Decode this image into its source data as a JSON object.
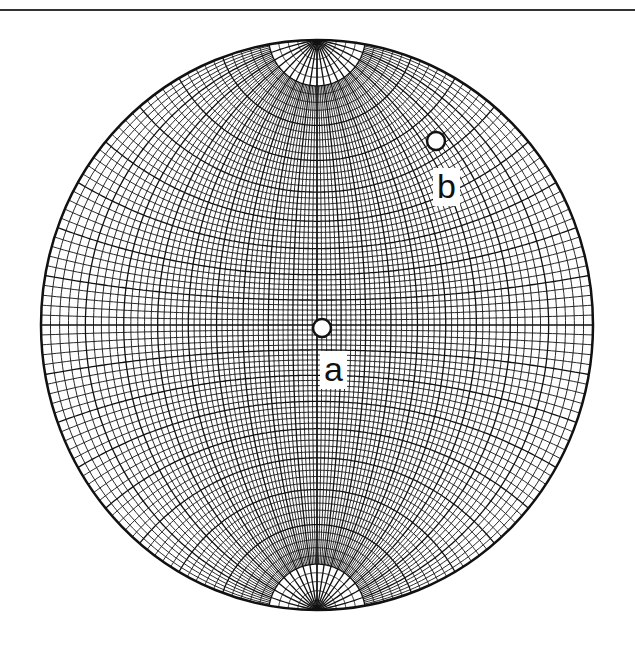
{
  "figure": {
    "type": "stereonet",
    "projection": "meridional (Wulff) net",
    "center": [
      317,
      325
    ],
    "radius_x": 276,
    "radius_y": 285,
    "grid_spacing_deg": 2,
    "pole_cap_latitude_deg": 80,
    "cap_meridian_spacing_deg": 10,
    "line_color": "#111111",
    "background": "#ffffff"
  },
  "points": [
    {
      "id": "a",
      "label": "a",
      "x": 322,
      "y": 328,
      "label_x": 320,
      "label_y": 351
    },
    {
      "id": "b",
      "label": "b",
      "x": 436,
      "y": 141,
      "label_x": 433,
      "label_y": 168
    }
  ]
}
